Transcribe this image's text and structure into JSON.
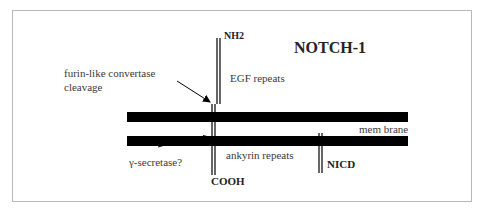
{
  "title": "NOTCH-1",
  "labels": {
    "nh2": "NH2",
    "cooh": "COOH",
    "nicd": "NICD",
    "egf": "EGF repeats",
    "ankyrin": "ankyrin repeats",
    "membrane": "mem brane",
    "furin_line1": "furin-like convertase",
    "furin_line2": "cleavage",
    "gamma": "γ-secretase?"
  },
  "colors": {
    "ink": "#000000",
    "text": "#333333",
    "frame": "#b8b8b8"
  }
}
